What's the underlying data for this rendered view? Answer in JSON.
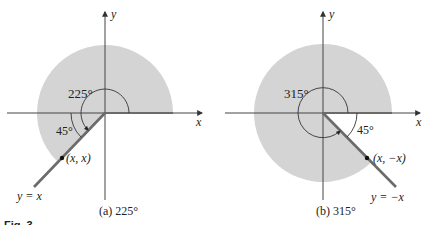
{
  "figure_label": "Fig. 3",
  "colors": {
    "shade": "#d4d4d4",
    "axis": "#333333",
    "terminal_side": "#6b6b6b",
    "text": "#222222"
  },
  "panels": [
    {
      "id": "a",
      "caption": "(a)  225°",
      "angle_label": "225°",
      "ref_angle_label": "45°",
      "line_label": "y = x",
      "point_label": "(x, x)",
      "x_axis_label": "x",
      "y_axis_label": "y",
      "angle_degrees": 225
    },
    {
      "id": "b",
      "caption": "(b)  315°",
      "angle_label": "315°",
      "ref_angle_label": "45°",
      "line_label": "y = −x",
      "point_label": "(x, −x)",
      "x_axis_label": "x",
      "y_axis_label": "y",
      "angle_degrees": 315
    }
  ]
}
